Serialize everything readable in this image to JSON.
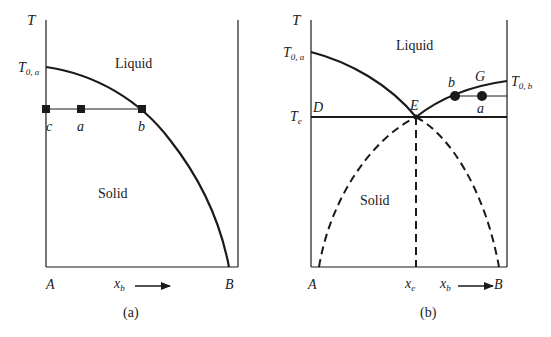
{
  "panel_a": {
    "caption": "(a)",
    "y_axis_label": "T",
    "t0a_label": "T",
    "t0a_sub": "0, a",
    "liquid_label": "Liquid",
    "solid_label": "Solid",
    "point_c": "c",
    "point_a": "a",
    "point_b": "b",
    "x_left_label": "A",
    "x_right_label": "B",
    "x_var": "x",
    "x_var_sub": "b"
  },
  "panel_b": {
    "caption": "(b)",
    "y_axis_label": "T",
    "t0a_label": "T",
    "t0a_sub": "0, a",
    "t0b_label": "T",
    "t0b_sub": "0, b",
    "te_label": "T",
    "te_sub": "e",
    "liquid_label": "Liquid",
    "solid_label": "Solid",
    "point_D": "D",
    "point_E": "E",
    "point_G": "G",
    "point_b": "b",
    "point_a": "a",
    "x_left_label": "A",
    "x_right_label": "B",
    "xe_label": "x",
    "xe_sub": "e",
    "x_var": "x",
    "x_var_sub": "b"
  },
  "colors": {
    "line": "#1a1a1a",
    "background": "#ffffff"
  }
}
